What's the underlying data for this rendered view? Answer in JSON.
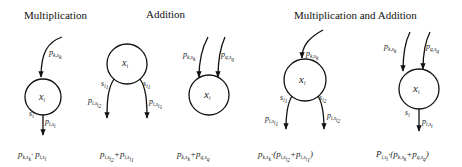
{
  "titles": {
    "multiplication": "Multiplication",
    "addition": "Addition",
    "mult_and_add": "Multiplication and Addition"
  },
  "diagrams": [
    {
      "id": "mult",
      "node": "x_i",
      "in_edges": [
        "p_{k,s_k}"
      ],
      "out_edges": [
        {
          "state": "s_i",
          "prob": "p_{i,s_i}"
        }
      ],
      "formula": "p_{k,s_k} · p_{i,s_i}"
    },
    {
      "id": "add-split",
      "node": "x_i",
      "in_edges": [],
      "out_edges": [
        {
          "state": "s_{i_1}",
          "prob": "p_{i,s_{i_2}}"
        },
        {
          "state": "s_{i_1}",
          "prob": "p_{i,s_{i_1}}"
        }
      ],
      "formula": "p_{i,s_{i_2}} + p_{i,s_{i_1}}"
    },
    {
      "id": "add-merge",
      "node": "x_i",
      "in_edges": [
        "p_{k,s_k}",
        "p_{q,s_q}"
      ],
      "out_edges": [],
      "formula": "p_{k,s_k} + p_{q,s_q}"
    },
    {
      "id": "mult-add-split",
      "node": "x_i",
      "in_edges": [
        "p_{k,s_k}"
      ],
      "out_edges": [
        {
          "state": "s_{i_1}",
          "prob": "p_{i,s_{i_1}}"
        },
        {
          "state": "s_{i_2}",
          "prob": "p_{i,s_{i_2}}"
        }
      ],
      "formula": "p_{k,s_k} · (p_{i,s_{i_2}} + p_{i,s_{i_1}})"
    },
    {
      "id": "mult-add-merge",
      "node": "x_i",
      "in_edges": [
        "p_{k,s_k}",
        "p_{q,s_q}"
      ],
      "out_edges": [
        {
          "state": "s_i",
          "prob": "p_{i,s_i}"
        }
      ],
      "formula": "P_{i,s_i} · (p_{k,s_k} + p_{q,s_q})"
    }
  ],
  "text": {
    "x": "x",
    "i": "i",
    "p": "p",
    "P": "P",
    "s": "s",
    "k_sk": "k,s",
    "k": "k",
    "q_sq": "q,s",
    "q": "q",
    "i_si": "i,s",
    "i1": "i",
    "one": "1",
    "two": "2",
    "dot": "·",
    "plus": "+",
    "lpar": "(",
    "rpar": ")"
  }
}
